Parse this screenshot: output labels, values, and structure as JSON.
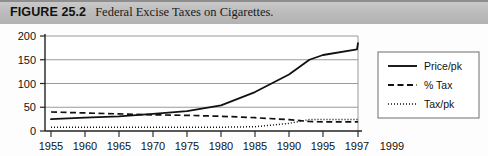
{
  "caption": {
    "figure_number": "FIGURE 25.2",
    "title": "Federal Excise Taxes on Cigarettes."
  },
  "chart_data": {
    "type": "line",
    "title": "Federal Excise Taxes on Cigarettes.",
    "xlabel": "",
    "ylabel": "",
    "xlim": [
      1955,
      1999
    ],
    "ylim": [
      0,
      200
    ],
    "yticks": [
      0,
      50,
      100,
      150,
      200
    ],
    "xticks": [
      1955,
      1960,
      1965,
      1970,
      1975,
      1980,
      1985,
      1990,
      1995,
      1997,
      1999
    ],
    "xtick_labels": [
      "1955",
      "1960",
      "1965",
      "1970",
      "1975",
      "1980",
      "1985",
      "1990",
      "1995",
      "1997",
      "1999"
    ],
    "ytick_labels": [
      "0",
      "50",
      "100",
      "150",
      "200"
    ],
    "grid": "horizontal",
    "legend_position": "right-outside",
    "x": [
      1955,
      1960,
      1965,
      1970,
      1975,
      1980,
      1985,
      1990,
      1993,
      1995,
      1997,
      1999
    ],
    "series": [
      {
        "name": "Price/pk",
        "style": "solid",
        "values": [
          25,
          28,
          31,
          36,
          42,
          54,
          82,
          119,
          150,
          160,
          172,
          185
        ]
      },
      {
        "name": "% Tax",
        "style": "dashed",
        "values": [
          40,
          38,
          36,
          34,
          33,
          31,
          28,
          24,
          20,
          19,
          19,
          20
        ]
      },
      {
        "name": "Tax/pk",
        "style": "dotted",
        "values": [
          8,
          8,
          8,
          8,
          8,
          8,
          9,
          16,
          24,
          24,
          24,
          24
        ]
      }
    ]
  },
  "legend": {
    "entries": [
      {
        "label": "Price/pk",
        "style": "solid"
      },
      {
        "label": "% Tax",
        "style": "dashed"
      },
      {
        "label": "Tax/pk",
        "style": "dotted"
      }
    ]
  },
  "colors": {
    "band": "#bcbcbc",
    "ink": "#111111",
    "grid": "#9a9a9a",
    "axis": "#333333",
    "plot_bg": "#ffffff"
  }
}
